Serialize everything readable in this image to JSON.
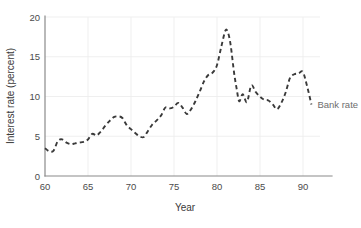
{
  "figure": {
    "background": "#ffffff",
    "line_color": "#3a3a3a",
    "grid_color": "#ededed",
    "axis_color": "#8a8a8a",
    "tick_text_color": "#4b4b4b",
    "legend_text_color": "#6e6e6e"
  },
  "axis": {
    "y_title": "Interest rate (percent)",
    "x_title": "Year",
    "y_ticks": [
      "0",
      "5",
      "10",
      "15",
      "20"
    ],
    "x_ticks": [
      "60",
      "65",
      "70",
      "75",
      "80",
      "85",
      "90"
    ]
  },
  "legend": {
    "series_label": "Bank rate"
  },
  "chart_data": {
    "type": "line",
    "title": "",
    "subtitle": "",
    "xlabel": "Year",
    "ylabel": "Interest rate (percent)",
    "xlim": [
      60,
      92
    ],
    "ylim": [
      0,
      20
    ],
    "xtick_values": [
      60,
      65,
      70,
      75,
      80,
      85,
      90
    ],
    "xtick_labels": [
      "60",
      "65",
      "70",
      "75",
      "80",
      "85",
      "90"
    ],
    "ytick_values": [
      0,
      5,
      10,
      15,
      20
    ],
    "ytick_labels": [
      "0",
      "5",
      "10",
      "15",
      "20"
    ],
    "grid": true,
    "grid_axis": "both",
    "legend_position": "inline-right-of-line-end",
    "line_style": "dashed",
    "series": [
      {
        "name": "Bank rate",
        "color": "#3a3a3a",
        "x": [
          60,
          60.5,
          61,
          61.5,
          62,
          62.5,
          63,
          63.5,
          64,
          64.5,
          65,
          65.5,
          66,
          66.5,
          67,
          67.5,
          68,
          68.5,
          69,
          69.5,
          70,
          70.5,
          71,
          71.5,
          72,
          72.5,
          73,
          73.5,
          74,
          74.5,
          75,
          75.5,
          76,
          76.5,
          77,
          77.5,
          78,
          78.5,
          79,
          79.5,
          80,
          80.5,
          81,
          81.3,
          81.6,
          82,
          82.3,
          82.6,
          83,
          83.5,
          84,
          84.5,
          85,
          85.5,
          86,
          86.5,
          87,
          87.5,
          88,
          88.5,
          89,
          89.5,
          90,
          90.5,
          91
        ],
        "values": [
          3.5,
          3.1,
          3.2,
          4.4,
          4.6,
          4.2,
          4.0,
          4.1,
          4.2,
          4.3,
          4.6,
          5.3,
          5.1,
          5.6,
          6.3,
          6.9,
          7.4,
          7.5,
          7.3,
          6.4,
          5.9,
          5.4,
          5.0,
          4.9,
          5.7,
          6.5,
          7.0,
          7.6,
          8.6,
          8.5,
          8.7,
          9.2,
          8.6,
          7.8,
          8.4,
          9.4,
          10.6,
          11.9,
          12.7,
          13.0,
          13.9,
          16.2,
          18.3,
          18.0,
          16.5,
          13.0,
          11.0,
          9.4,
          10.3,
          9.3,
          11.4,
          10.6,
          10.0,
          9.6,
          9.5,
          9.0,
          8.4,
          9.2,
          10.5,
          12.3,
          12.8,
          12.9,
          13.1,
          11.3,
          9.0
        ]
      }
    ]
  }
}
